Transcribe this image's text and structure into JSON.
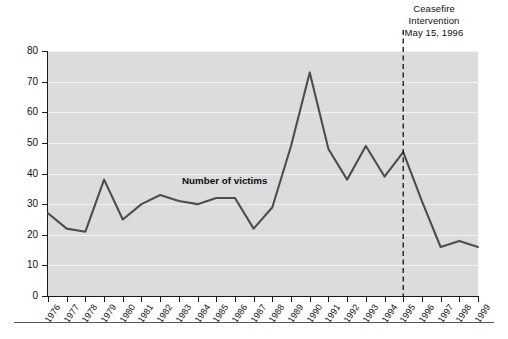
{
  "chart_data": {
    "type": "line",
    "title": "",
    "subtitle": "",
    "xlabel": "",
    "ylabel": "",
    "grid": true,
    "legend_position": "inline",
    "xlim": [
      1976,
      1999
    ],
    "ylim": [
      0,
      80
    ],
    "yticks": [
      0,
      10,
      20,
      30,
      40,
      50,
      60,
      70,
      80
    ],
    "categories": [
      "1976",
      "1977",
      "1978",
      "1979",
      "1980",
      "1981",
      "1982",
      "1983",
      "1984",
      "1985",
      "1986",
      "1987",
      "1988",
      "1989",
      "1990",
      "1991",
      "1992",
      "1993",
      "1994",
      "1995",
      "1996",
      "1997",
      "1998",
      "1999"
    ],
    "series": [
      {
        "name": "Number of victims",
        "values": [
          27,
          22,
          21,
          38,
          25,
          30,
          33,
          31,
          30,
          32,
          32,
          22,
          29,
          49,
          73,
          48,
          38,
          49,
          39,
          47,
          31,
          16,
          18,
          16
        ]
      }
    ],
    "annotations": [
      {
        "name": "ceasefire-event",
        "lines": [
          "Ceasefire",
          "Intervention",
          "May 15, 1996"
        ],
        "x_position": "1995",
        "style": "vertical-dashed-line"
      },
      {
        "name": "series-inline-label",
        "text": "Number of victims"
      }
    ],
    "colors": {
      "plot_background": "#dcdcdc",
      "gridline": "#f2f2f2",
      "series_line": "#4d4d4d",
      "axis": "#1a1a1a",
      "event_line": "#111111",
      "page_background": "#ffffff",
      "text": "#101010"
    }
  },
  "axes": {
    "y": {
      "ticks": [
        "80",
        "70",
        "60",
        "50",
        "40",
        "30",
        "20",
        "10",
        "0"
      ]
    },
    "x": {
      "ticks": [
        "1976",
        "1977",
        "1978",
        "1979",
        "1980",
        "1981",
        "1982",
        "1983",
        "1984",
        "1985",
        "1986",
        "1987",
        "1988",
        "1989",
        "1990",
        "1991",
        "1992",
        "1993",
        "1994",
        "1995",
        "1996",
        "1997",
        "1998",
        "1999"
      ]
    }
  },
  "annotation": {
    "line1": "Ceasefire",
    "line2": "Intervention",
    "line3": "May 15, 1996"
  },
  "series_label": {
    "text": "Number of victims"
  }
}
